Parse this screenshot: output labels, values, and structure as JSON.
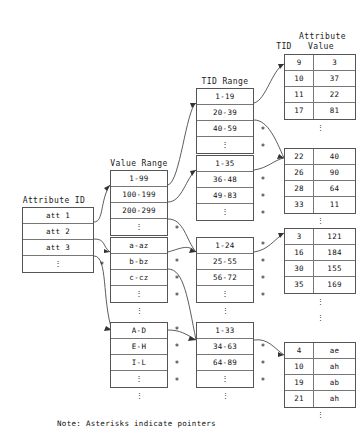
{
  "diagram": {
    "note": "Note: Asterisks indicate pointers",
    "headers": {
      "attribute_id": "Attribute ID",
      "value_range": "Value Range",
      "tid_range": "TID Range",
      "tid": "TID",
      "attribute_value_line1": "Attribute",
      "attribute_value_line2": "Value"
    },
    "ellipsis": "⋮",
    "asterisk": "*",
    "attribute_id_table": {
      "rows": [
        "att 1",
        "att 2",
        "att 3",
        "⋮"
      ],
      "pointer_rows": [
        false,
        false,
        false,
        true
      ]
    },
    "value_range_tables": [
      {
        "rows": [
          "1-99",
          "100-199",
          "200-299",
          "⋮"
        ],
        "pointer_rows": [
          false,
          false,
          false,
          true
        ]
      },
      {
        "rows": [
          "a-az",
          "b-bz",
          "c-cz",
          "⋮"
        ],
        "pointer_rows": [
          false,
          true,
          true,
          true
        ]
      },
      {
        "rows": [
          "A-D",
          "E-H",
          "I-L",
          "⋮"
        ],
        "pointer_rows": [
          true,
          true,
          true,
          true
        ]
      }
    ],
    "tid_range_tables": [
      {
        "rows": [
          "1-19",
          "20-39",
          "40-59",
          "⋮"
        ],
        "pointer_rows": [
          false,
          false,
          true,
          true
        ]
      },
      {
        "rows": [
          "1-35",
          "36-48",
          "49-83",
          "⋮"
        ],
        "pointer_rows": [
          false,
          true,
          true,
          true
        ]
      },
      {
        "rows": [
          "1-24",
          "25-55",
          "56-72",
          "⋮"
        ],
        "pointer_rows": [
          true,
          true,
          true,
          true
        ]
      },
      {
        "rows": [
          "1-33",
          "34-63",
          "64-89",
          "⋮"
        ],
        "pointer_rows": [
          false,
          true,
          true,
          true
        ]
      }
    ],
    "tid_value_tables": [
      {
        "rows": [
          {
            "tid": "9",
            "value": "3"
          },
          {
            "tid": "10",
            "value": "37"
          },
          {
            "tid": "11",
            "value": "22"
          },
          {
            "tid": "17",
            "value": "81"
          }
        ]
      },
      {
        "rows": [
          {
            "tid": "22",
            "value": "40"
          },
          {
            "tid": "26",
            "value": "90"
          },
          {
            "tid": "28",
            "value": "64"
          },
          {
            "tid": "33",
            "value": "11"
          }
        ]
      },
      {
        "rows": [
          {
            "tid": "3",
            "value": "121"
          },
          {
            "tid": "16",
            "value": "184"
          },
          {
            "tid": "30",
            "value": "155"
          },
          {
            "tid": "35",
            "value": "169"
          }
        ]
      },
      {
        "rows": [
          {
            "tid": "4",
            "value": "ae"
          },
          {
            "tid": "10",
            "value": "ah"
          },
          {
            "tid": "19",
            "value": "ab"
          },
          {
            "tid": "21",
            "value": "ah"
          }
        ]
      }
    ]
  }
}
